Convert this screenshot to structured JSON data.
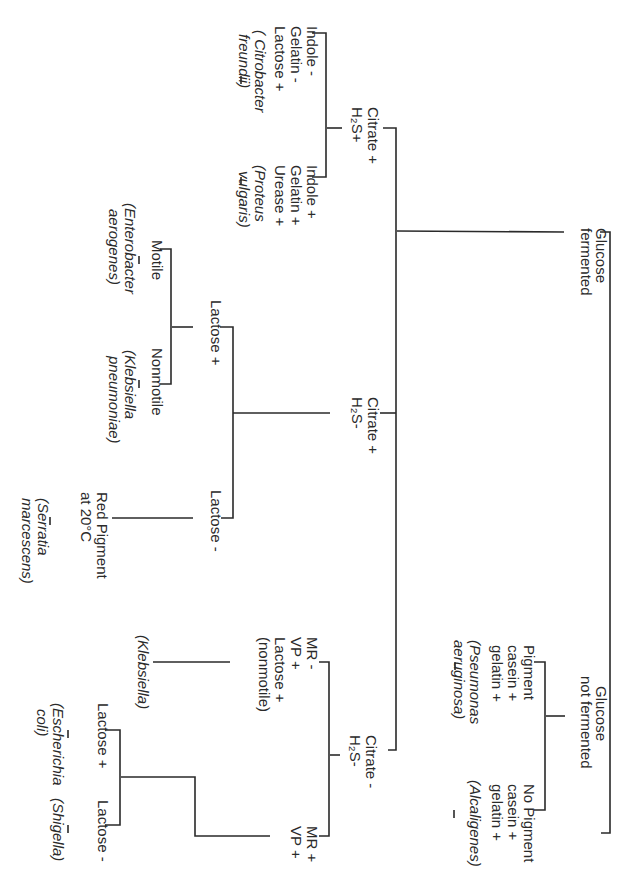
{
  "diagram": {
    "type": "dichotomous identification key (rotated 90°)",
    "root_split": {
      "left": {
        "lines": [
          "Glucose",
          "fermented"
        ]
      },
      "right": {
        "lines": [
          "Glucose",
          "not fermented"
        ]
      }
    },
    "fermented": {
      "citrate_pos_h2s_pos": {
        "lines": [
          "Citrate +",
          "H₂S+"
        ],
        "a": {
          "lines": [
            "Indole -",
            "Gelatin -",
            "Lactose +"
          ],
          "organism": [
            "( Citrobacter",
            "freundii)"
          ]
        },
        "b": {
          "lines": [
            "Indole +",
            "Gelatin +",
            "Urease +"
          ],
          "organism": [
            "(Proteus",
            "vulgaris)"
          ]
        }
      },
      "citrate_pos_h2s_neg": {
        "lines": [
          "Citrate +",
          "H₂S-"
        ],
        "lactose_pos": {
          "label": "Lactose +",
          "motile": {
            "label": "Motile",
            "organism": [
              "(Enterobacter",
              "aerogenes)"
            ]
          },
          "nonmotile": {
            "label": "Nonmotile",
            "organism": [
              "(Klebsiella",
              "pneumoniae)"
            ]
          }
        },
        "lactose_neg": {
          "label": "Lactose -",
          "a": {
            "lines": [
              "Red Pigment",
              "at 20°C"
            ],
            "organism": [
              "(Serratia",
              "marcescens)"
            ]
          }
        }
      },
      "citrate_neg_h2s_neg": {
        "lines": [
          "Citrate -",
          "H₂S-"
        ],
        "mr_neg": {
          "lines": [
            "MR -",
            "VP +",
            "Lactose +",
            "(nonmotile)"
          ],
          "organism": [
            "(Klebsiella)"
          ]
        },
        "mr_pos": {
          "lines": [
            "MR +",
            "VP +"
          ],
          "lactose_pos": {
            "label": "Lactose +",
            "organism": [
              "(Escherichia",
              "coli)"
            ]
          },
          "lactose_neg": {
            "label": "Lactose -",
            "organism": [
              "(Shigella)"
            ]
          }
        }
      }
    },
    "not_fermented": {
      "pigment": {
        "lines": [
          "Pigment",
          "casein +",
          "gelatin +"
        ],
        "organism": [
          "(Pseumonas",
          "aeruginosa)"
        ]
      },
      "no_pigment": {
        "lines": [
          "No Pigment",
          "casein +",
          "gelatin +"
        ],
        "organism": [
          "(Alcaligenes)"
        ]
      }
    },
    "colors": {
      "ink": "#2a2a2a",
      "background": "#ffffff"
    }
  }
}
